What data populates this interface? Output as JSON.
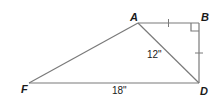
{
  "diagram": {
    "type": "geometry-figure",
    "vertices": [
      {
        "id": "A",
        "label": "A",
        "x": 138,
        "y": 23,
        "label_x": 130,
        "label_y": 20
      },
      {
        "id": "B",
        "label": "B",
        "x": 199,
        "y": 23,
        "label_x": 201,
        "label_y": 21
      },
      {
        "id": "D",
        "label": "D",
        "x": 199,
        "y": 83,
        "label_x": 200,
        "label_y": 95
      },
      {
        "id": "F",
        "label": "F",
        "x": 29,
        "y": 83,
        "label_x": 20,
        "label_y": 93
      }
    ],
    "segments": [
      {
        "from": "A",
        "to": "B"
      },
      {
        "from": "B",
        "to": "D"
      },
      {
        "from": "D",
        "to": "F"
      },
      {
        "from": "F",
        "to": "A"
      },
      {
        "from": "A",
        "to": "D"
      }
    ],
    "measurements": [
      {
        "segment": "AD",
        "label": "12\"",
        "x": 147,
        "y": 58
      },
      {
        "segment": "FD",
        "label": "18\"",
        "x": 112,
        "y": 94
      }
    ],
    "congruence_marks": [
      {
        "segment": "AB",
        "count": 1
      },
      {
        "segment": "BD",
        "count": 1
      }
    ],
    "right_angle": {
      "at": "B"
    },
    "stroke_color": "#7a7a7a",
    "label_color": "#1a1a1a"
  }
}
